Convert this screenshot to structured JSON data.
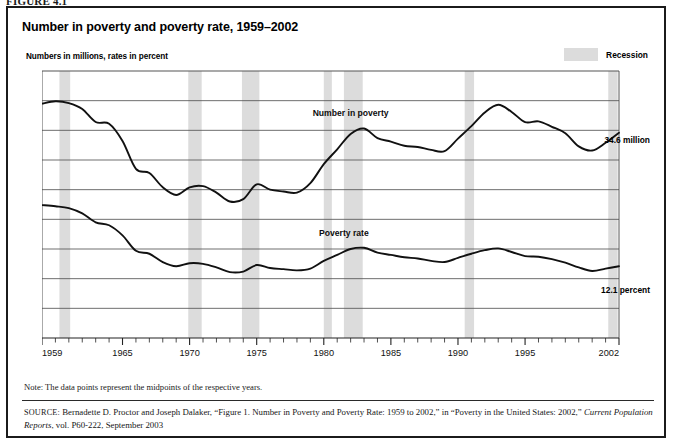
{
  "figure": {
    "number_label": "FIGURE 4.1",
    "title": "Number in poverty and poverty rate, 1959–2002",
    "subtitle": "Numbers in millions, rates in percent"
  },
  "legend": {
    "recession_label": "Recession",
    "recession_color": "#dcdcdc"
  },
  "end_labels": {
    "number_in_poverty": "34.6 million",
    "poverty_rate": "12.1 percent"
  },
  "series_labels": {
    "number_in_poverty": "Number in poverty",
    "poverty_rate": "Poverty rate"
  },
  "note": "Note: The data points represent the midpoints of the respective years.",
  "source": {
    "prefix": "SOURCE:",
    "line1": " Bernadette D. Proctor and Joseph Dalaker, “Figure 1. Number in Poverty and Poverty Rate: 1959 to 2002,” in “Poverty in the United States: 2002,”",
    "italic_part": "Current Population Reports",
    "line2": ", vol. P60-222, September 2003"
  },
  "chart_data": {
    "type": "line",
    "title": "Number in poverty and poverty rate, 1959–2002",
    "subtitle": "Numbers in millions, rates in percent",
    "xlabel": "",
    "ylabel": "",
    "xlim": [
      1959,
      2002
    ],
    "ylim": [
      0,
      45
    ],
    "ytick_values": [
      0,
      5,
      10,
      15,
      20,
      25,
      30,
      35,
      40,
      45
    ],
    "ytick_labels": [
      "0",
      "5",
      "10",
      "15",
      "20",
      "25",
      "30",
      "35",
      "40",
      "45"
    ],
    "xtick_labels": [
      "1959",
      "1965",
      "1970",
      "1975",
      "1980",
      "1985",
      "1990",
      "1995",
      "2002"
    ],
    "xtick_values": [
      1959,
      1965,
      1970,
      1975,
      1980,
      1985,
      1990,
      1995,
      2002
    ],
    "minor_ticks_every": 1,
    "grid": "horizontal",
    "legend_position": "top-right",
    "line_color": "#111111",
    "x": [
      1959,
      1960,
      1961,
      1962,
      1963,
      1964,
      1965,
      1966,
      1967,
      1968,
      1969,
      1970,
      1971,
      1972,
      1973,
      1974,
      1975,
      1976,
      1977,
      1978,
      1979,
      1980,
      1981,
      1982,
      1983,
      1984,
      1985,
      1986,
      1987,
      1988,
      1989,
      1990,
      1991,
      1992,
      1993,
      1994,
      1995,
      1996,
      1997,
      1998,
      1999,
      2000,
      2001,
      2002
    ],
    "series": [
      {
        "name": "Number in poverty",
        "unit": "millions",
        "end_label": "34.6 million",
        "values": [
          39.5,
          39.9,
          39.6,
          38.6,
          36.4,
          36.1,
          33.2,
          28.5,
          27.8,
          25.4,
          24.1,
          25.4,
          25.6,
          24.5,
          23.0,
          23.4,
          25.9,
          25.0,
          24.7,
          24.5,
          26.1,
          29.3,
          31.8,
          34.4,
          35.3,
          33.7,
          33.1,
          32.4,
          32.2,
          31.7,
          31.5,
          33.6,
          35.7,
          38.0,
          39.3,
          38.1,
          36.4,
          36.5,
          35.6,
          34.5,
          32.3,
          31.6,
          32.9,
          34.6
        ]
      },
      {
        "name": "Poverty rate",
        "unit": "percent",
        "end_label": "12.1 percent",
        "values": [
          22.4,
          22.2,
          21.9,
          21.0,
          19.5,
          19.0,
          17.3,
          14.7,
          14.2,
          12.8,
          12.1,
          12.6,
          12.5,
          11.9,
          11.1,
          11.2,
          12.3,
          11.8,
          11.6,
          11.4,
          11.7,
          13.0,
          14.0,
          15.0,
          15.2,
          14.4,
          14.0,
          13.6,
          13.4,
          13.0,
          12.8,
          13.5,
          14.2,
          14.8,
          15.1,
          14.5,
          13.8,
          13.7,
          13.3,
          12.7,
          11.9,
          11.3,
          11.7,
          12.1
        ]
      }
    ],
    "recessions": [
      {
        "start": 1960.3,
        "end": 1961.1
      },
      {
        "start": 1969.9,
        "end": 1970.9
      },
      {
        "start": 1973.9,
        "end": 1975.2
      },
      {
        "start": 1980.0,
        "end": 1980.6
      },
      {
        "start": 1981.5,
        "end": 1982.9
      },
      {
        "start": 1990.5,
        "end": 1991.2
      },
      {
        "start": 2001.2,
        "end": 2001.9
      }
    ],
    "annotations": [
      {
        "text": "Number in poverty",
        "x": 1982,
        "y": 37.5
      },
      {
        "text": "Poverty rate",
        "x": 1981.5,
        "y": 17.2
      }
    ]
  }
}
